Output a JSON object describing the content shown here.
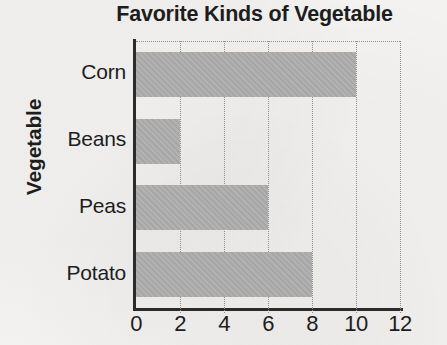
{
  "chart_data": {
    "type": "bar",
    "orientation": "horizontal",
    "title": "Favorite Kinds of Vegetable",
    "xlabel": "",
    "ylabel": "Vegetable",
    "categories": [
      "Corn",
      "Beans",
      "Peas",
      "Potato"
    ],
    "values": [
      10,
      2,
      6,
      8
    ],
    "xlim": [
      0,
      12
    ],
    "xticks": [
      "0",
      "2",
      "4",
      "6",
      "8",
      "10",
      "12"
    ],
    "xtick_values": [
      0,
      2,
      4,
      6,
      8,
      10,
      12
    ],
    "grid": true,
    "grid_style": "dotted-vertical",
    "legend": null,
    "bar_color": "#adadad",
    "axis_color": "#2b2b2b",
    "grid_color": "#8f8f8f",
    "background_color": "#f2f2f0",
    "text_color": "#1d1d1d"
  }
}
